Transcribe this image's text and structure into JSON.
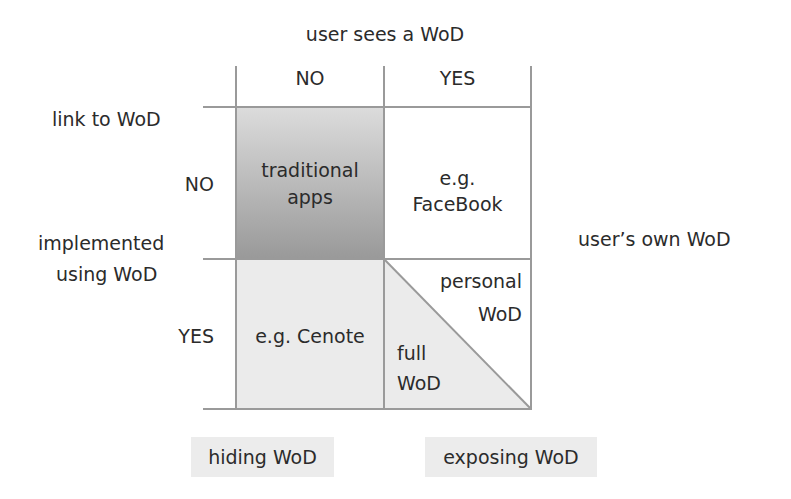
{
  "diagram": {
    "column_axis": {
      "title": "user sees a WoD",
      "values": [
        "NO",
        "YES"
      ]
    },
    "row_axis": {
      "title_line1": "link to WoD",
      "values": [
        "NO",
        "YES"
      ]
    },
    "row_group_label": {
      "line1": "implemented",
      "line2": "using WoD"
    },
    "cells": {
      "no_no": {
        "line1": "traditional",
        "line2": "apps"
      },
      "no_yes": {
        "line1": "e.g.",
        "line2": "FaceBook"
      },
      "yes_no": {
        "line1": "e.g. Cenote"
      },
      "yes_yes_upper": {
        "line1": "personal",
        "line2": "WoD"
      },
      "yes_yes_lower": {
        "line1": "full",
        "line2": "WoD"
      }
    },
    "side_label": "user’s own WoD",
    "bottom_tags": [
      "hiding WoD",
      "exposing WoD"
    ],
    "colors": {
      "grid_line": "#9a9a9a",
      "traditional_top": "#dcdcdc",
      "traditional_bottom": "#999999",
      "light_cell": "#ebebeb",
      "tag_bg": "#ececec"
    }
  }
}
